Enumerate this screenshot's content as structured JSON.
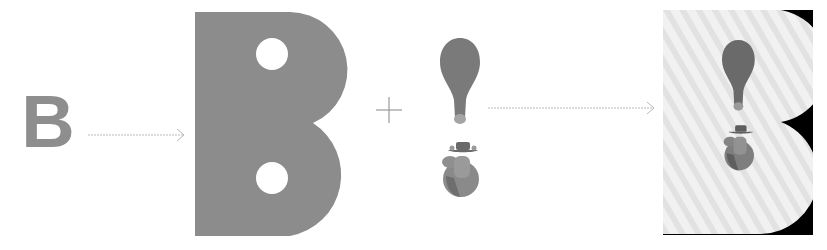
{
  "diagram": {
    "steps": [
      {
        "id": "source-letter",
        "label": "B"
      },
      {
        "id": "arrow-1",
        "type": "dotted-arrow"
      },
      {
        "id": "b-mask",
        "type": "shape",
        "shape": "B with two circular holes"
      },
      {
        "id": "plus",
        "label": "+"
      },
      {
        "id": "figure",
        "type": "graphic",
        "parts": [
          "exclamation-drop",
          "mascot-with-hat"
        ]
      },
      {
        "id": "arrow-2",
        "type": "dotted-arrow"
      },
      {
        "id": "result",
        "type": "composite",
        "shape": "striped B on black with figure"
      }
    ],
    "colors": {
      "grey": "#8e8e8e",
      "mask_grey": "#8c8c8c",
      "drop": "#7a7a7a",
      "drop_tip": "#a4a4a4",
      "mascot": "#8a8a8a",
      "arrow": "#b9b9b9",
      "result_bg": "#000000",
      "result_light": "#ececec"
    }
  }
}
